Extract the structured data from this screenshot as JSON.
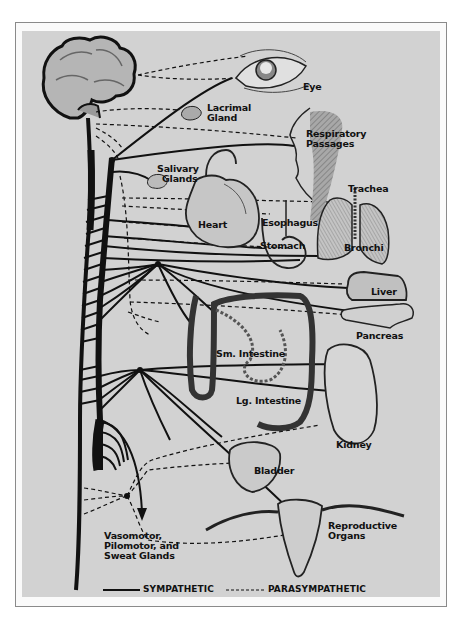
{
  "diagram": {
    "type": "autonomic-nervous-system",
    "labels": {
      "eye": "Eye",
      "lacrimal_1": "Lacrimal",
      "lacrimal_2": "Gland",
      "respiratory_1": "Respiratory",
      "respiratory_2": "Passages",
      "salivary_1": "Salivary",
      "salivary_2": "Glands",
      "trachea": "Trachea",
      "heart": "Heart",
      "esophagus": "Esophagus",
      "stomach": "Stomach",
      "bronchi": "Bronchi",
      "liver": "Liver",
      "pancreas": "Pancreas",
      "small_intestine": "Sm. Intestine",
      "large_intestine": "Lg. Intestine",
      "kidney": "Kidney",
      "bladder": "Bladder",
      "reproductive_1": "Reproductive",
      "reproductive_2": "Organs",
      "vasomotor_1": "Vasomotor,",
      "vasomotor_2": "Pilomotor, and",
      "vasomotor_3": "Sweat Glands"
    },
    "legend": {
      "sympathetic": "SYMPATHETIC",
      "parasympathetic": "PARASYMPATHETIC"
    },
    "colors": {
      "background": "#d2d2d2",
      "ink": "#111111",
      "frame": "#8a8a8a"
    }
  }
}
